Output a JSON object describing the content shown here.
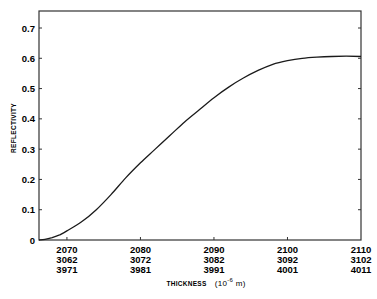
{
  "chart_data": {
    "type": "line",
    "title": "",
    "xlabel": "THICKNESS",
    "xlabel_unit": "(10",
    "xlabel_unit_exp": "-6",
    "xlabel_unit_tail": " m)",
    "ylabel": "REFLECTIVITY",
    "ylim": [
      0,
      0.75
    ],
    "xlim": [
      2066.2,
      2110
    ],
    "y_ticks": [
      "0",
      "0.1",
      "0.2",
      "0.3",
      "0.4",
      "0.5",
      "0.6",
      "0.7"
    ],
    "x_tick_rows": [
      [
        "2070",
        "2080",
        "2090",
        "2100",
        "2110"
      ],
      [
        "3062",
        "3072",
        "3082",
        "3092",
        "3102"
      ],
      [
        "3971",
        "3981",
        "3991",
        "4001",
        "4011"
      ]
    ],
    "x_tick_values": [
      2070,
      2080,
      2090,
      2100,
      2110
    ],
    "grid": false,
    "legend": null,
    "series": [
      {
        "name": "reflectivity",
        "x": [
          2066.2,
          2067,
          2068,
          2069,
          2070,
          2072,
          2074,
          2076,
          2078,
          2080,
          2082,
          2084,
          2086,
          2088,
          2090,
          2092,
          2094,
          2096,
          2098,
          2100,
          2102,
          2104,
          2106,
          2108,
          2110
        ],
        "values": [
          0.0,
          0.002,
          0.008,
          0.017,
          0.03,
          0.06,
          0.1,
          0.15,
          0.205,
          0.255,
          0.3,
          0.345,
          0.39,
          0.43,
          0.47,
          0.505,
          0.535,
          0.56,
          0.58,
          0.592,
          0.6,
          0.604,
          0.606,
          0.607,
          0.606
        ]
      }
    ]
  }
}
